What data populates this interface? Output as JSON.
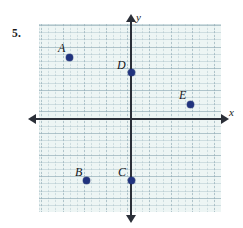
{
  "problem": {
    "number_label": "5."
  },
  "figure": {
    "type": "coordinate-plane-scatter",
    "background_color": "#edf5f4",
    "grid_line_color": "#a4bcc4",
    "axis_color": "#2b2f38",
    "point_color": "#21337e",
    "axes": {
      "x_label": "x",
      "y_label": "y",
      "x_axis_name": "x-axis",
      "y_axis_name": "y-axis",
      "arrows": {
        "x_right": "arrow-right",
        "x_left": "arrow-left",
        "y_up": "arrow-up",
        "y_down": "arrow-down"
      }
    },
    "grid": {
      "minor_spacing_px": 7.2,
      "major_spacing_px": 21.6,
      "left_px": 39,
      "top_px": 24,
      "width_px": 182,
      "height_px": 188
    },
    "origin_px": {
      "x": 131,
      "y": 119
    },
    "points": [
      {
        "label": "A",
        "px": {
          "x": 69,
          "y": 57
        },
        "label_px": {
          "x": 58,
          "y": 42
        },
        "quadrant": 2,
        "on_axis": false
      },
      {
        "label": "B",
        "px": {
          "x": 86,
          "y": 180
        },
        "label_px": {
          "x": 75,
          "y": 166
        },
        "quadrant": 3,
        "on_axis": false
      },
      {
        "label": "C",
        "px": {
          "x": 131,
          "y": 180
        },
        "label_px": {
          "x": 118,
          "y": 166
        },
        "quadrant": 0,
        "on_axis": true
      },
      {
        "label": "D",
        "px": {
          "x": 131,
          "y": 72
        },
        "label_px": {
          "x": 117,
          "y": 59
        },
        "quadrant": 0,
        "on_axis": true
      },
      {
        "label": "E",
        "px": {
          "x": 190,
          "y": 104
        },
        "label_px": {
          "x": 179,
          "y": 89
        },
        "quadrant": 1,
        "on_axis": false
      }
    ]
  },
  "chart_data": {
    "type": "scatter",
    "title": "",
    "xlabel": "x",
    "ylabel": "y",
    "grid": true,
    "legend": "none",
    "xlim": [
      -5,
      5
    ],
    "ylim": [
      -5,
      5
    ],
    "xticks": [],
    "yticks": [],
    "point_labels": [
      "A",
      "B",
      "C",
      "D",
      "E"
    ],
    "points": [
      {
        "label": "A",
        "x": -3,
        "y": 3
      },
      {
        "label": "B",
        "x": -2,
        "y": -3
      },
      {
        "label": "C",
        "x": 0,
        "y": -3
      },
      {
        "label": "D",
        "x": 0,
        "y": 2
      },
      {
        "label": "E",
        "x": 3,
        "y": 1
      }
    ]
  }
}
